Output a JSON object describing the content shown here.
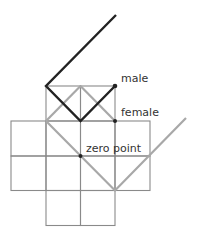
{
  "diagram": {
    "type": "grid-path-diagram",
    "colors": {
      "background": "#ffffff",
      "grid": "#8a8a8a",
      "male_path": "#222222",
      "female_path": "#a8a8a8",
      "point": "#222222",
      "label": "#333333"
    },
    "labels": {
      "male": "male",
      "female": "female",
      "zero_point": "zero point"
    },
    "points": [
      {
        "name": "male",
        "x": 115,
        "y": 86
      },
      {
        "name": "female",
        "x": 115,
        "y": 121
      },
      {
        "name": "zero point",
        "x": 80,
        "y": 156
      }
    ]
  }
}
